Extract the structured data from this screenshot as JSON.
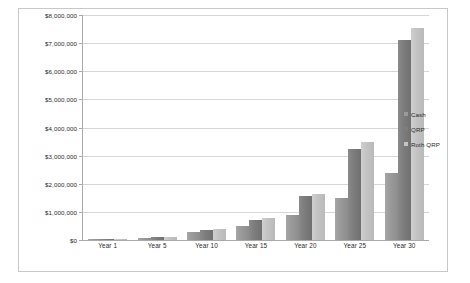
{
  "chart_data": {
    "type": "bar",
    "title": "",
    "subtitle": "",
    "xlabel": "",
    "ylabel": "",
    "categories": [
      "Year 1",
      "Year 5",
      "Year 10",
      "Year 15",
      "Year 20",
      "Year 25",
      "Year 30"
    ],
    "series": [
      {
        "name": "Cash",
        "color": "#9a9a9a",
        "values": [
          12000,
          85000,
          280000,
          500000,
          900000,
          1500000,
          2370000
        ]
      },
      {
        "name": "QRP",
        "color": "#7d7d7d",
        "values": [
          15000,
          110000,
          370000,
          720000,
          1550000,
          3250000,
          7100000
        ]
      },
      {
        "name": "Roth QRP",
        "color": "#c4c4c4",
        "values": [
          16000,
          120000,
          400000,
          780000,
          1650000,
          3500000,
          7550000
        ]
      }
    ],
    "ylim": [
      0,
      8000000
    ],
    "ytick_values": [
      0,
      1000000,
      2000000,
      3000000,
      4000000,
      5000000,
      6000000,
      7000000,
      8000000
    ],
    "ytick_labels": [
      "$0",
      "$1,000,000",
      "$2,000,000",
      "$3,000,000",
      "$4,000,000",
      "$5,000,000",
      "$6,000,000",
      "$7,000,000",
      "$8,000,000"
    ],
    "grid": true,
    "legend_position": "right",
    "legend_entries": [
      "Cash",
      "QRP",
      "Roth QRP"
    ],
    "plot_background": "#ffffff",
    "gridline_color": "#d6d6d6",
    "axis_color": "#a9a9a9",
    "frame_border_color": "#c8c8c8"
  }
}
